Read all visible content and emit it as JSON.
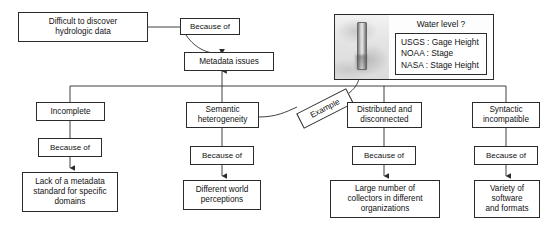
{
  "diagram": {
    "type": "flowchart",
    "line_color": "#2b2b2b",
    "background": "#ffffff"
  },
  "nodes": {
    "root_problem": "Difficult to discover\nhydrologic data",
    "root_connector": "Because of",
    "central": "Metadata issues",
    "branch1": "Incomplete",
    "branch1_connector": "Because of",
    "branch1_cause": "Lack of a metadata\nstandard for specific\ndomains",
    "branch2": "Semantic\nheterogeneity",
    "branch2_connector": "Because of",
    "branch2_cause": "Different world\nperceptions",
    "branch3": "Distributed and\ndisconnected",
    "branch3_connector": "Because of",
    "branch3_cause": "Large number of\ncollectors in different\norganizations",
    "branch4": "Syntactic\nincompatible",
    "branch4_connector": "Because of",
    "branch4_cause": "Variety of\nsoftware\nand formats",
    "example_tag": "Example"
  },
  "water_panel": {
    "title": "Water level ?",
    "photo_alt": "gauge-staff-photo",
    "entries": [
      "USGS : Gage Height",
      "NOAA : Stage",
      "NASA : Stage Height"
    ]
  }
}
